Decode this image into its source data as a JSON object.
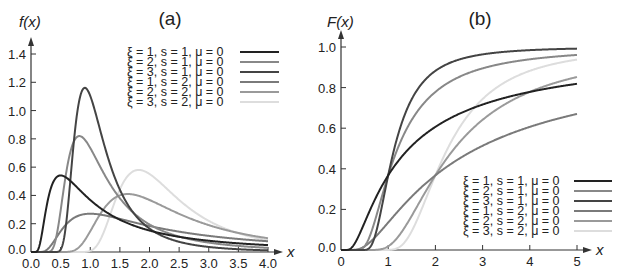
{
  "chart_data": [
    {
      "type": "line",
      "title": "(a)",
      "xlabel": "x",
      "ylabel": "f(x)",
      "xlim": [
        0,
        4
      ],
      "ylim": [
        0,
        1.4
      ],
      "xticks": [
        "0.0",
        "0.5",
        "1.0",
        "1.5",
        "2.0",
        "2.5",
        "3.0",
        "3.5",
        "4.0"
      ],
      "yticks": [
        "0.0",
        "0.2",
        "0.4",
        "0.6",
        "0.8",
        "1.0",
        "1.2",
        "1.4"
      ],
      "grid": false,
      "legend_position": "upper right",
      "function": "Frechet PDF",
      "series": [
        {
          "name": "ξ = 1, s = 1, μ = 0",
          "xi": 1,
          "s": 1,
          "mu": 0,
          "color": "#222222",
          "peak": [
            0.5,
            0.54
          ]
        },
        {
          "name": "ξ = 2, s = 1, μ = 0",
          "xi": 2,
          "s": 1,
          "mu": 0,
          "color": "#888888",
          "peak": [
            0.82,
            0.82
          ]
        },
        {
          "name": "ξ = 3, s = 1, μ = 0",
          "xi": 3,
          "s": 1,
          "mu": 0,
          "color": "#444444",
          "peak": [
            0.91,
            1.16
          ]
        },
        {
          "name": "ξ = 1, s = 2, μ = 0",
          "xi": 1,
          "s": 2,
          "mu": 0,
          "color": "#7a7a7a",
          "peak": [
            1.0,
            0.27
          ]
        },
        {
          "name": "ξ = 2, s = 2, μ = 0",
          "xi": 2,
          "s": 2,
          "mu": 0,
          "color": "#9a9a9a",
          "peak": [
            1.63,
            0.41
          ]
        },
        {
          "name": "ξ = 3, s = 2, μ = 0",
          "xi": 3,
          "s": 2,
          "mu": 0,
          "color": "#dddddd",
          "peak": [
            1.82,
            0.58
          ]
        }
      ]
    },
    {
      "type": "line",
      "title": "(b)",
      "xlabel": "x",
      "ylabel": "F(x)",
      "xlim": [
        0,
        5
      ],
      "ylim": [
        0,
        1.0
      ],
      "xticks": [
        "0",
        "1",
        "2",
        "3",
        "4",
        "5"
      ],
      "yticks": [
        "0.0",
        "0.2",
        "0.4",
        "0.6",
        "0.8",
        "1.0"
      ],
      "grid": false,
      "legend_position": "lower right",
      "function": "Frechet CDF",
      "series": [
        {
          "name": "ξ = 1, s = 1, μ = 0",
          "xi": 1,
          "s": 1,
          "mu": 0,
          "color": "#222222",
          "value_at_5": 0.82
        },
        {
          "name": "ξ = 2, s = 1, μ = 0",
          "xi": 2,
          "s": 1,
          "mu": 0,
          "color": "#888888",
          "value_at_5": 0.96
        },
        {
          "name": "ξ = 3, s = 1, μ = 0",
          "xi": 3,
          "s": 1,
          "mu": 0,
          "color": "#444444",
          "value_at_5": 0.99
        },
        {
          "name": "ξ = 1, s = 2, μ = 0",
          "xi": 1,
          "s": 2,
          "mu": 0,
          "color": "#7a7a7a",
          "value_at_5": 0.67
        },
        {
          "name": "ξ = 2, s = 2, μ = 0",
          "xi": 2,
          "s": 2,
          "mu": 0,
          "color": "#9a9a9a",
          "value_at_5": 0.85
        },
        {
          "name": "ξ = 3, s = 2, μ = 0",
          "xi": 3,
          "s": 2,
          "mu": 0,
          "color": "#dddddd",
          "value_at_5": 0.94
        }
      ]
    }
  ]
}
